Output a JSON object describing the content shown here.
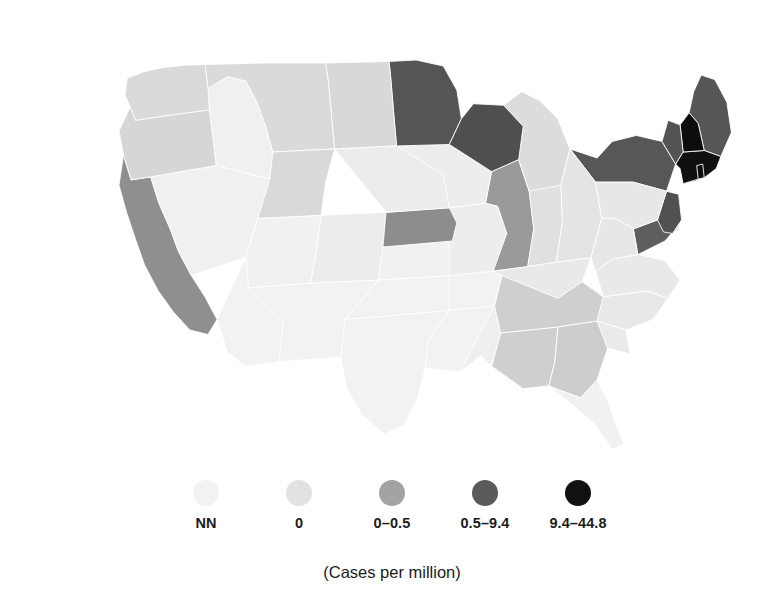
{
  "figure": {
    "type": "choropleth-map",
    "region": "United States (contiguous 48 states)",
    "caption": "(Cases per million)"
  },
  "legend": {
    "caption": "(Cases per million)",
    "items": [
      {
        "label": "NN",
        "color": "#f2f2f2"
      },
      {
        "label": "0",
        "color": "#e2e2e2"
      },
      {
        "label": "0–0.5",
        "color": "#a3a3a3"
      },
      {
        "label": "0.5–9.4",
        "color": "#5a5a5a"
      },
      {
        "label": "9.4–44.8",
        "color": "#111111"
      }
    ]
  },
  "chart_data": {
    "type": "heatmap",
    "title": "",
    "subtitle": "",
    "xlabel": "",
    "ylabel": "",
    "legend_position": "bottom",
    "grid": false,
    "value_unit": "Cases per million",
    "bins": [
      {
        "label": "NN",
        "color": "#f2f2f2",
        "range": "not notifiable"
      },
      {
        "label": "0",
        "color": "#e2e2e2",
        "range": "0"
      },
      {
        "label": "0–0.5",
        "color": "#a3a3a3",
        "range": "0 to 0.5"
      },
      {
        "label": "0.5–9.4",
        "color": "#5a5a5a",
        "range": "0.5 to 9.4"
      },
      {
        "label": "9.4–44.8",
        "color": "#111111",
        "range": "9.4 to 44.8"
      }
    ],
    "categories": [
      "AL",
      "AZ",
      "AR",
      "CA",
      "CO",
      "CT",
      "DE",
      "FL",
      "GA",
      "ID",
      "IL",
      "IN",
      "IA",
      "KS",
      "KY",
      "LA",
      "ME",
      "MD",
      "MA",
      "MI",
      "MN",
      "MS",
      "MO",
      "MT",
      "NE",
      "NV",
      "NH",
      "NJ",
      "NM",
      "NY",
      "NC",
      "ND",
      "OH",
      "OK",
      "OR",
      "PA",
      "RI",
      "SC",
      "SD",
      "TN",
      "TX",
      "UT",
      "VT",
      "VA",
      "WA",
      "WV",
      "WI",
      "WY"
    ],
    "values": [
      "0–0.5",
      "NN",
      "NN",
      "0–0.5",
      "0",
      "9.4–44.8",
      "0",
      "NN",
      "0–0.5",
      "NN",
      "0–0.5",
      "0",
      "0",
      "NN",
      "0",
      "NN",
      "0.5–9.4",
      "0.5–9.4",
      "9.4–44.8",
      "0",
      "0.5–9.4",
      "NN",
      "0",
      "0",
      "0–0.5",
      "NN",
      "9.4–44.8",
      "0.5–9.4",
      "NN",
      "0.5–9.4",
      "0",
      "0",
      "0",
      "NN",
      "0",
      "0",
      "9.4–44.8",
      "0",
      "0",
      "0–0.5",
      "NN",
      "NN",
      "0.5–9.4",
      "0",
      "0",
      "0",
      "0.5–9.4",
      "0"
    ],
    "states": [
      {
        "code": "AL",
        "name": "Alabama",
        "bin": "0–0.5",
        "color": "#cfcfcf"
      },
      {
        "code": "AZ",
        "name": "Arizona",
        "bin": "NN",
        "color": "#f2f2f2"
      },
      {
        "code": "AR",
        "name": "Arkansas",
        "bin": "NN",
        "color": "#f2f2f2"
      },
      {
        "code": "CA",
        "name": "California",
        "bin": "0–0.5",
        "color": "#8f8f8f"
      },
      {
        "code": "CO",
        "name": "Colorado",
        "bin": "0",
        "color": "#ececec"
      },
      {
        "code": "CT",
        "name": "Connecticut",
        "bin": "9.4–44.8",
        "color": "#111111"
      },
      {
        "code": "DE",
        "name": "Delaware",
        "bin": "0",
        "color": "#e6e6e6"
      },
      {
        "code": "FL",
        "name": "Florida",
        "bin": "NN",
        "color": "#f1f1f1"
      },
      {
        "code": "GA",
        "name": "Georgia",
        "bin": "0–0.5",
        "color": "#cdcdcd"
      },
      {
        "code": "ID",
        "name": "Idaho",
        "bin": "NN",
        "color": "#f0f0f0"
      },
      {
        "code": "IL",
        "name": "Illinois",
        "bin": "0–0.5",
        "color": "#9a9a9a"
      },
      {
        "code": "IN",
        "name": "Indiana",
        "bin": "0",
        "color": "#e0e0e0"
      },
      {
        "code": "IA",
        "name": "Iowa",
        "bin": "0",
        "color": "#ededed"
      },
      {
        "code": "KS",
        "name": "Kansas",
        "bin": "NN",
        "color": "#f1f1f1"
      },
      {
        "code": "KY",
        "name": "Kentucky",
        "bin": "0",
        "color": "#e9e9e9"
      },
      {
        "code": "LA",
        "name": "Louisiana",
        "bin": "NN",
        "color": "#f2f2f2"
      },
      {
        "code": "ME",
        "name": "Maine",
        "bin": "0.5–9.4",
        "color": "#565656"
      },
      {
        "code": "MD",
        "name": "Maryland",
        "bin": "0.5–9.4",
        "color": "#5e5e5e"
      },
      {
        "code": "MA",
        "name": "Massachusetts",
        "bin": "9.4–44.8",
        "color": "#101010"
      },
      {
        "code": "MI",
        "name": "Michigan",
        "bin": "0",
        "color": "#dcdcdc"
      },
      {
        "code": "MN",
        "name": "Minnesota",
        "bin": "0.5–9.4",
        "color": "#555555"
      },
      {
        "code": "MS",
        "name": "Mississippi",
        "bin": "NN",
        "color": "#efefef"
      },
      {
        "code": "MO",
        "name": "Missouri",
        "bin": "0",
        "color": "#ededed"
      },
      {
        "code": "MT",
        "name": "Montana",
        "bin": "0",
        "color": "#dadada"
      },
      {
        "code": "NE",
        "name": "Nebraska",
        "bin": "0–0.5",
        "color": "#8d8d8d"
      },
      {
        "code": "NV",
        "name": "Nevada",
        "bin": "NN",
        "color": "#f0f0f0"
      },
      {
        "code": "NH",
        "name": "New Hampshire",
        "bin": "9.4–44.8",
        "color": "#0d0d0d"
      },
      {
        "code": "NJ",
        "name": "New Jersey",
        "bin": "0.5–9.4",
        "color": "#515151"
      },
      {
        "code": "NM",
        "name": "New Mexico",
        "bin": "NN",
        "color": "#f2f2f2"
      },
      {
        "code": "NY",
        "name": "New York",
        "bin": "0.5–9.4",
        "color": "#575757"
      },
      {
        "code": "NC",
        "name": "North Carolina",
        "bin": "0",
        "color": "#e8e8e8"
      },
      {
        "code": "ND",
        "name": "North Dakota",
        "bin": "0",
        "color": "#d8d8d8"
      },
      {
        "code": "OH",
        "name": "Ohio",
        "bin": "0",
        "color": "#e4e4e4"
      },
      {
        "code": "OK",
        "name": "Oklahoma",
        "bin": "NN",
        "color": "#f2f2f2"
      },
      {
        "code": "OR",
        "name": "Oregon",
        "bin": "0",
        "color": "#d6d6d6"
      },
      {
        "code": "PA",
        "name": "Pennsylvania",
        "bin": "0",
        "color": "#e7e7e7"
      },
      {
        "code": "RI",
        "name": "Rhode Island",
        "bin": "9.4–44.8",
        "color": "#0f0f0f"
      },
      {
        "code": "SC",
        "name": "South Carolina",
        "bin": "0",
        "color": "#eaeaea"
      },
      {
        "code": "SD",
        "name": "South Dakota",
        "bin": "0",
        "color": "#ececec"
      },
      {
        "code": "TN",
        "name": "Tennessee",
        "bin": "0–0.5",
        "color": "#cfcfcf"
      },
      {
        "code": "TX",
        "name": "Texas",
        "bin": "NN",
        "color": "#f2f2f2"
      },
      {
        "code": "UT",
        "name": "Utah",
        "bin": "NN",
        "color": "#f1f1f1"
      },
      {
        "code": "VT",
        "name": "Vermont",
        "bin": "0.5–9.4",
        "color": "#545454"
      },
      {
        "code": "VA",
        "name": "Virginia",
        "bin": "0",
        "color": "#e9e9e9"
      },
      {
        "code": "WA",
        "name": "Washington",
        "bin": "0",
        "color": "#d9d9d9"
      },
      {
        "code": "WV",
        "name": "West Virginia",
        "bin": "0",
        "color": "#e7e7e7"
      },
      {
        "code": "WI",
        "name": "Wisconsin",
        "bin": "0.5–9.4",
        "color": "#4f4f4f"
      },
      {
        "code": "WY",
        "name": "Wyoming",
        "bin": "0",
        "color": "#d9d9d9"
      }
    ]
  }
}
